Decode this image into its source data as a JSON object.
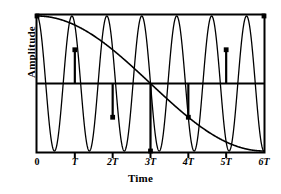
{
  "chart_data": {
    "type": "line",
    "title": "",
    "xlabel": "Time",
    "ylabel": "Amplitude",
    "xlim": [
      0,
      6
    ],
    "ylim": [
      -1.05,
      1.05
    ],
    "grid": false,
    "legend": null,
    "x_tick_labels": [
      "0",
      "T",
      "2T",
      "3T",
      "4T",
      "5T",
      "6T"
    ],
    "x_tick_values": [
      0,
      1,
      2,
      3,
      4,
      5,
      6
    ],
    "y_tick_labels": [],
    "zero_line": 0,
    "series": [
      {
        "name": "high-frequency-signal",
        "type": "line",
        "description": "Fast sine wave, 6.5 cycles over 0 to 6T",
        "cycles_over_span": 6.5,
        "amplitude": 1,
        "phase": "cosine",
        "color": "#000000"
      },
      {
        "name": "aliased-signal",
        "type": "line",
        "description": "Slow aliased cosine envelope, 0.5 cycle over 0 to 6T, minimum at 3T",
        "cycles_over_span": 0.5,
        "amplitude": 1,
        "phase": "cosine",
        "color": "#000000"
      }
    ],
    "sample_points": {
      "name": "sample-markers",
      "x": [
        0,
        1,
        2,
        3,
        4,
        5,
        6
      ],
      "y": [
        1.0,
        0.5,
        -0.5,
        -1.0,
        -0.5,
        0.5,
        1.0
      ],
      "marker": "square-dot",
      "color": "#000000"
    }
  },
  "labels": {
    "x_axis_title": "Time",
    "y_axis_title": "Amplitude",
    "ticks": [
      {
        "text": "0",
        "italic": false
      },
      {
        "text": "T",
        "italic": true
      },
      {
        "text": "2T",
        "italic": true
      },
      {
        "text": "3T",
        "italic": true
      },
      {
        "text": "4T",
        "italic": true
      },
      {
        "text": "5T",
        "italic": true
      },
      {
        "text": "6T",
        "italic": true
      }
    ]
  },
  "colors": {
    "ink": "#000000",
    "background": "#ffffff"
  }
}
